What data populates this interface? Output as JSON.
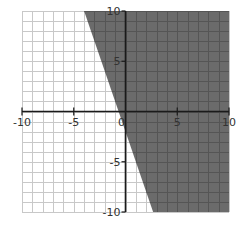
{
  "chart_data": {
    "type": "area",
    "title": "",
    "xlabel": "",
    "ylabel": "",
    "xlim": [
      -10,
      10
    ],
    "ylim": [
      -10,
      10
    ],
    "grid": true,
    "grid_step": 1,
    "boundary_line": {
      "equation": "y = -3x - 2",
      "slope": -3,
      "intercept": -2,
      "style": "solid",
      "points": [
        [
          -4,
          10
        ],
        [
          2.67,
          -10
        ]
      ]
    },
    "shaded_region": {
      "inequality": "y >= -3x - 2",
      "side": "right",
      "color": "#6b6b6b"
    },
    "x_tick_labels": [
      "-10",
      "-5",
      "0",
      "5",
      "10"
    ],
    "x_ticks": [
      -10,
      -5,
      0,
      5,
      10
    ],
    "y_tick_labels": [
      "10",
      "5",
      "-5",
      "-10"
    ],
    "y_ticks": [
      10,
      5,
      -5,
      -10
    ],
    "legend": null
  },
  "colors": {
    "shade": "#6b6b6b",
    "grid_light": "#c8c8c8",
    "grid_dark": "#555555",
    "axis": "#1a1a1a"
  }
}
